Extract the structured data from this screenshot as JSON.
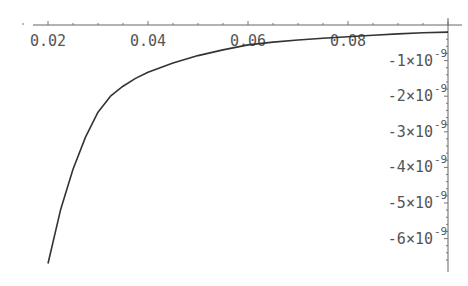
{
  "chart_data": {
    "type": "line",
    "title": "",
    "xlabel": "",
    "ylabel": "",
    "xlim": [
      0.0145,
      0.104
    ],
    "ylim": [
      -6.9e-09,
      0.0
    ],
    "x_ticks": [
      0.02,
      0.04,
      0.06,
      0.08
    ],
    "x_tick_labels": [
      "0.02",
      "0.04",
      "0.06",
      "0.08"
    ],
    "y_ticks": [
      -1e-09,
      -2e-09,
      -3e-09,
      -4e-09,
      -5e-09,
      -6e-09
    ],
    "y_tick_labels": [
      "-1×10",
      "-2×10",
      "-3×10",
      "-4×10",
      "-5×10",
      "-6×10"
    ],
    "y_tick_exponent": "-9",
    "axes_origin": {
      "x": 0.1,
      "y": 0.0
    },
    "grid": false,
    "series": [
      {
        "name": "f(x)",
        "color": "#333333",
        "x": [
          0.02,
          0.0225,
          0.025,
          0.0275,
          0.03,
          0.0325,
          0.035,
          0.0375,
          0.04,
          0.045,
          0.05,
          0.055,
          0.06,
          0.065,
          0.07,
          0.075,
          0.08,
          0.085,
          0.09,
          0.095,
          0.1
        ],
        "y": [
          -6.7e-09,
          -5.2e-09,
          -4.05e-09,
          -3.15e-09,
          -2.45e-09,
          -2e-09,
          -1.72e-09,
          -1.5e-09,
          -1.33e-09,
          -1.07e-09,
          -8.6e-10,
          -7e-10,
          -5.6e-10,
          -4.8e-10,
          -4.2e-10,
          -3.7e-10,
          -3.3e-10,
          -2.9e-10,
          -2.5e-10,
          -2.2e-10,
          -2e-10
        ]
      }
    ]
  }
}
